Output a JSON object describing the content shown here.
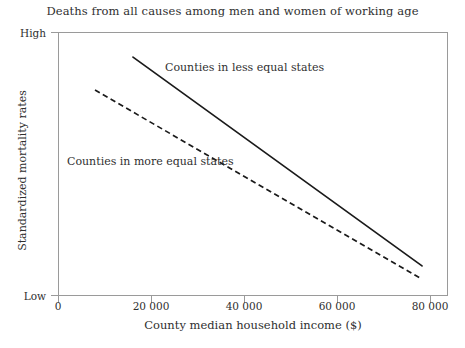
{
  "chart_data": {
    "type": "line",
    "title": "Deaths from all causes among men and women of working age",
    "xlabel": "County median household income ($)",
    "ylabel": "Standardized mortality rates",
    "xlim": [
      0,
      83871
    ],
    "ylim": [
      0,
      1
    ],
    "grid": false,
    "legend_position": "inline-annotations",
    "x_ticks": [
      {
        "value": 0,
        "label": "0"
      },
      {
        "value": 20000,
        "label": "20 000"
      },
      {
        "value": 40000,
        "label": "40 000"
      },
      {
        "value": 60000,
        "label": "60 000"
      },
      {
        "value": 80000,
        "label": "80 000"
      }
    ],
    "y_ticks": [
      {
        "value": 1,
        "label": "High"
      },
      {
        "value": 0,
        "label": "Low"
      }
    ],
    "series": [
      {
        "name": "Counties in less equal states",
        "style": "solid",
        "color": "#1a1a1a",
        "x": [
          16129,
          78280
        ],
        "y": [
          0.905,
          0.114
        ],
        "annotation": "Counties in less equal states"
      },
      {
        "name": "Counties in more equal states",
        "style": "dashed",
        "color": "#1a1a1a",
        "x": [
          7957,
          77849
        ],
        "y": [
          0.78,
          0.068
        ],
        "annotation": "Counties in more equal states"
      }
    ]
  },
  "axes": {
    "frame_color": "#9a9a9a",
    "tick_color": "#9a9a9a"
  }
}
